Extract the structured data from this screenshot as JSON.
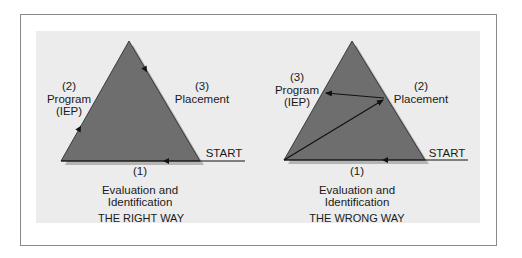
{
  "colors": {
    "triangle_fill": "#6e6e6e",
    "triangle_shadow": "#a8a8a8",
    "panel_bg": "#ececec",
    "frame_border": "#8a8a8a",
    "line": "#111111"
  },
  "left_diagram": {
    "step2": {
      "number": "(2)",
      "label": "Program",
      "sub": "(IEP)"
    },
    "step3": {
      "number": "(3)",
      "label": "Placement"
    },
    "start": "START",
    "step1": {
      "number": "(1)",
      "label_line1": "Evaluation and",
      "label_line2": "Identification"
    },
    "caption": "THE RIGHT WAY"
  },
  "right_diagram": {
    "step3": {
      "number": "(3)",
      "label": "Program",
      "sub": "(IEP)"
    },
    "step2": {
      "number": "(2)",
      "label": "Placement"
    },
    "start": "START",
    "step1": {
      "number": "(1)",
      "label_line1": "Evaluation and",
      "label_line2": "Identification"
    },
    "caption": "THE WRONG WAY"
  }
}
